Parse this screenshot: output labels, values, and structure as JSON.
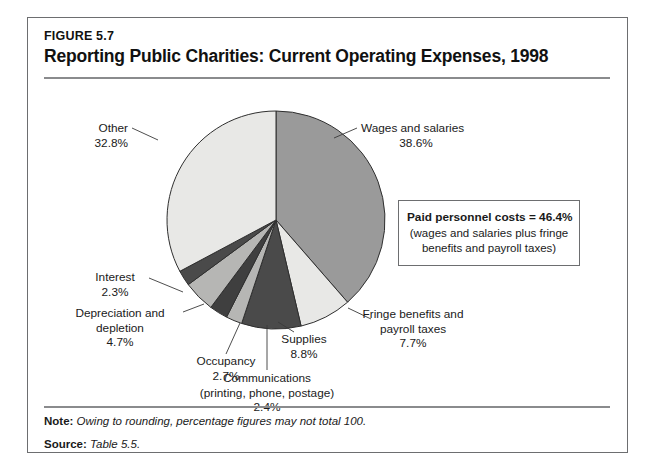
{
  "figure": {
    "number": "FIGURE 5.7",
    "title": "Reporting Public Charities: Current Operating Expenses, 1998"
  },
  "callout": {
    "title": "Paid personnel costs = 46.4%",
    "sub_line1": "(wages and salaries plus fringe",
    "sub_line2": "benefits and payroll taxes)"
  },
  "footer": {
    "note_label": "Note:",
    "note_text": "Owing to rounding, percentage figures may not total 100.",
    "source_label": "Source:",
    "source_text": "Table 5.5."
  },
  "labels": {
    "other": {
      "name": "Other",
      "value": "32.8%"
    },
    "wages": {
      "name": "Wages and salaries",
      "value": "38.6%"
    },
    "fringe": {
      "line1": "Fringe benefits and",
      "line2": "payroll taxes",
      "value": "7.7%"
    },
    "supplies": {
      "name": "Supplies",
      "value": "8.8%"
    },
    "communications": {
      "line1": "Communications",
      "line2": "(printing, phone, postage)",
      "value": "2.4%"
    },
    "occupancy": {
      "name": "Occupancy",
      "value": "2.7%"
    },
    "depreciation": {
      "line1": "Depreciation and",
      "line2": "depletion",
      "value": "4.7%"
    },
    "interest": {
      "name": "Interest",
      "value": "2.3%"
    }
  },
  "chart_data": {
    "type": "pie",
    "title": "Reporting Public Charities: Current Operating Expenses, 1998",
    "start_angle_deg": 0,
    "direction": "clockwise",
    "total_pct": 100,
    "categories": [
      "Wages and salaries",
      "Fringe benefits and payroll taxes",
      "Supplies",
      "Communications (printing, phone, postage)",
      "Occupancy",
      "Depreciation and depletion",
      "Interest",
      "Other"
    ],
    "values": [
      38.6,
      7.7,
      8.8,
      2.4,
      2.7,
      4.7,
      2.3,
      32.8
    ],
    "colors": [
      "#9a9a9a",
      "#e8e8e6",
      "#4a4a4a",
      "#b6b6b4",
      "#3f3f3f",
      "#b6b6b4",
      "#4a4a4a",
      "#e8e8e6"
    ],
    "legend": "none",
    "labels_position": "outside-with-leader-lines",
    "note": "Owing to rounding, percentage figures may not total 100.",
    "source": "Table 5.5."
  }
}
